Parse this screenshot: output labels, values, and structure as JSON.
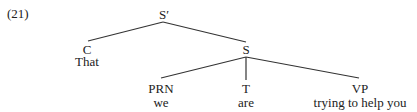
{
  "example_number": "(21)",
  "tree": {
    "root": {
      "label": "S′"
    },
    "nodes": [
      {
        "id": "C",
        "label": "C",
        "word": "That",
        "parent": "root"
      },
      {
        "id": "S",
        "label": "S",
        "parent": "root"
      },
      {
        "id": "PRN",
        "label": "PRN",
        "word": "we",
        "parent": "S"
      },
      {
        "id": "T",
        "label": "T",
        "word": "are",
        "parent": "S"
      },
      {
        "id": "VP",
        "label": "VP",
        "word": "trying to help you",
        "parent": "S"
      }
    ]
  },
  "colors": {
    "line": "#333333",
    "text": "#222222",
    "background": "#ffffff"
  }
}
